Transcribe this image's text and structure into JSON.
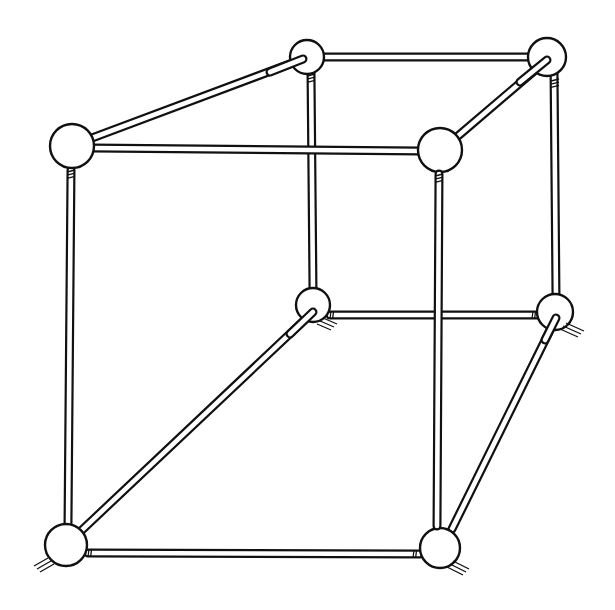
{
  "diagram": {
    "title": "Impossible cube (ball-and-stick frame)",
    "colors": {
      "ink": "#111111",
      "paper": "#ffffff"
    },
    "stick_width": 9,
    "nodes": [
      {
        "id": "front-top-left",
        "x": 72,
        "y": 146,
        "r": 22
      },
      {
        "id": "back-top-left",
        "x": 307,
        "y": 57,
        "r": 17
      },
      {
        "id": "back-top-right",
        "x": 547,
        "y": 57,
        "r": 19
      },
      {
        "id": "front-top-right",
        "x": 440,
        "y": 150,
        "r": 22
      },
      {
        "id": "back-bottom-left",
        "x": 313,
        "y": 305,
        "r": 17
      },
      {
        "id": "back-bottom-right",
        "x": 555,
        "y": 312,
        "r": 18
      },
      {
        "id": "front-bottom-left",
        "x": 66,
        "y": 545,
        "r": 21
      },
      {
        "id": "front-bottom-right",
        "x": 440,
        "y": 548,
        "r": 20
      }
    ],
    "sticks": [
      {
        "id": "back-right-vertical",
        "x1": 554,
        "y1": 70,
        "x2": 556,
        "y2": 296,
        "layer": 0
      },
      {
        "id": "back-bottom-edge",
        "x1": 330,
        "y1": 315,
        "x2": 538,
        "y2": 315,
        "layer": 0
      },
      {
        "id": "back-left-vertical",
        "x1": 311,
        "y1": 72,
        "x2": 313,
        "y2": 290,
        "layer": 1
      },
      {
        "id": "top-front-edge",
        "x1": 92,
        "y1": 148,
        "x2": 420,
        "y2": 151,
        "layer": 2
      },
      {
        "id": "top-back-edge",
        "x1": 323,
        "y1": 57,
        "x2": 530,
        "y2": 57,
        "layer": 0
      },
      {
        "id": "top-left-depth",
        "x1": 92,
        "y1": 138,
        "x2": 303,
        "y2": 59,
        "layer": 0
      },
      {
        "id": "top-right-depth",
        "x1": 458,
        "y1": 136,
        "x2": 547,
        "y2": 60,
        "layer": 0
      },
      {
        "id": "front-left-vertical",
        "x1": 71,
        "y1": 170,
        "x2": 68,
        "y2": 524,
        "layer": 1
      },
      {
        "id": "bottom-left-depth",
        "x1": 82,
        "y1": 530,
        "x2": 313,
        "y2": 312,
        "layer": 1
      },
      {
        "id": "bottom-right-depth",
        "x1": 452,
        "y1": 529,
        "x2": 556,
        "y2": 318,
        "layer": 1
      },
      {
        "id": "front-bottom-edge",
        "x1": 88,
        "y1": 553,
        "x2": 420,
        "y2": 554,
        "layer": 1
      },
      {
        "id": "front-right-vertical",
        "x1": 439,
        "y1": 174,
        "x2": 437,
        "y2": 526,
        "layer": 3
      }
    ]
  }
}
